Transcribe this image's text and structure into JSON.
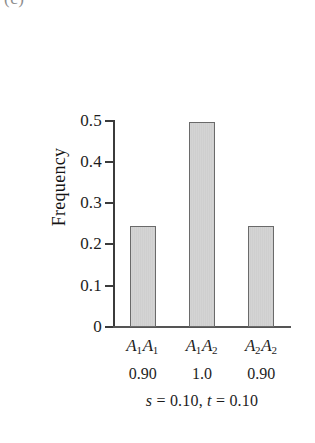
{
  "panel_letter": "(c)",
  "chart_data": {
    "type": "bar",
    "title": "",
    "xlabel": "",
    "ylabel": "Frequency",
    "categories": [
      "A1A1",
      "A1A2",
      "A2A2"
    ],
    "category_labels": [
      {
        "allele1": "A",
        "sub1": "1",
        "allele2": "A",
        "sub2": "1"
      },
      {
        "allele1": "A",
        "sub1": "1",
        "allele2": "A",
        "sub2": "2"
      },
      {
        "allele1": "A",
        "sub1": "2",
        "allele2": "A",
        "sub2": "2"
      }
    ],
    "values": [
      0.245,
      0.495,
      0.245
    ],
    "fitness_values": [
      "0.90",
      "1.0",
      "0.90"
    ],
    "ylim": [
      0,
      0.5
    ],
    "yticks": [
      0.5,
      0.4,
      0.3,
      0.2,
      0.1,
      0
    ],
    "ytick_labels": [
      "0.5",
      "0.4",
      "0.3",
      "0.2",
      "0.1",
      "0"
    ],
    "grid": false,
    "legend": "none",
    "bar_fill_color": "#d2d2d2",
    "bar_border_color": "#6a6a6a",
    "axis_color": "#3b3b3b"
  },
  "caption": {
    "s_symbol": "s",
    "s_value": "= 0.10,",
    "t_symbol": "t",
    "t_value": "= 0.10"
  }
}
